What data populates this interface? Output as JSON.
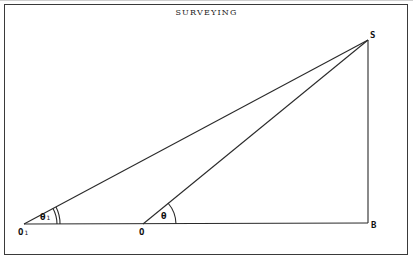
{
  "diagram": {
    "title": "SURVEYING",
    "points": {
      "S": {
        "label": "S",
        "x": 368,
        "y": 40
      },
      "B": {
        "label": "B",
        "x": 368,
        "y": 223
      },
      "O": {
        "label": "O",
        "x": 143,
        "y": 224
      },
      "O1": {
        "label": "O",
        "subscript": "1",
        "x": 24,
        "y": 224
      }
    },
    "segments": [
      {
        "from": "O1",
        "to": "B"
      },
      {
        "from": "O1",
        "to": "S"
      },
      {
        "from": "O",
        "to": "S"
      },
      {
        "from": "S",
        "to": "B"
      }
    ],
    "angles": [
      {
        "vertex": "O1",
        "label": "θ",
        "subscript": "1",
        "arcs": 2
      },
      {
        "vertex": "O",
        "label": "θ",
        "arcs": 1
      }
    ],
    "colors": {
      "line": "#2a2a2a",
      "frame": "#3a3a3a",
      "background": "#ffffff"
    }
  }
}
